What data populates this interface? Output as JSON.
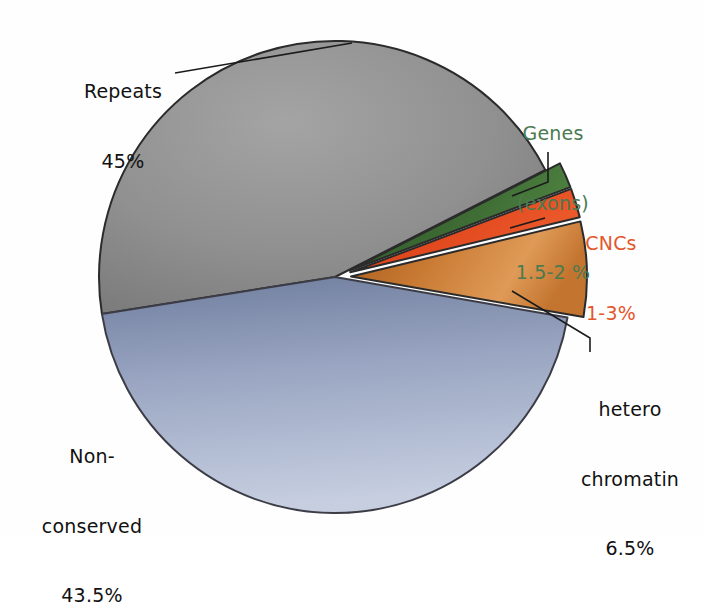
{
  "figure": {
    "background": "#ffffff",
    "center": {
      "x": 335,
      "y": 277
    },
    "radius": 236
  },
  "chart_data": {
    "type": "pie",
    "title": "",
    "subtitle": "",
    "xlabel": "",
    "ylabel": "",
    "legend_position": "none",
    "grid": false,
    "units": "percent of genome",
    "total": 100,
    "categories": [
      "Repeats",
      "Non-conserved",
      "hetero chromatin",
      "CNCs",
      "Genes (exons)"
    ],
    "values": [
      45,
      43.5,
      6.5,
      2,
      1.75
    ],
    "labels": [
      "45%",
      "43.5%",
      "6.5%",
      "1-3%",
      "1.5-2 %"
    ],
    "colors": [
      "#8a8a8a",
      "#8e9ab8",
      "#c87a33",
      "#e2491f",
      "#3d6b33"
    ],
    "slices": [
      {
        "key": "repeats",
        "name": "Repeats",
        "value": 45,
        "value_label": "45%",
        "color": "#8a8a8a",
        "color_dark": "#6e6e6e",
        "color_light": "#b4b4b4",
        "label_color": "#111111",
        "exploded": false,
        "start_angle_deg": 171,
        "end_angle_deg": 333
      },
      {
        "key": "genes",
        "name": "Genes (exons)",
        "value": 1.75,
        "value_label": "1.5-2 %",
        "color": "#3d6b33",
        "color_dark": "#2d5227",
        "color_light": "#4f8241",
        "label_color": "#4b7a4f",
        "exploded": true,
        "start_angle_deg": 333,
        "end_angle_deg": 339.3
      },
      {
        "key": "cncs",
        "name": "CNCs",
        "value": 2,
        "value_label": "1-3%",
        "color": "#e2491f",
        "color_dark": "#c33a14",
        "color_light": "#ef5c2b",
        "label_color": "#e2572c",
        "exploded": true,
        "start_angle_deg": 339.3,
        "end_angle_deg": 346.5
      },
      {
        "key": "heterochromatin",
        "name": "hetero chromatin",
        "value": 6.5,
        "value_label": "6.5%",
        "color": "#c87a33",
        "color_dark": "#a35b1e",
        "color_light": "#e09a55",
        "label_color": "#111111",
        "exploded": true,
        "start_angle_deg": 346.5,
        "end_angle_deg": 369.9
      },
      {
        "key": "non_conserved",
        "name": "Non-conserved",
        "value": 43.5,
        "value_label": "43.5%",
        "color": "#8e9ab8",
        "color_dark": "#6d7b9c",
        "color_light": "#c2cbdd",
        "label_color": "#111111",
        "exploded": false,
        "start_angle_deg": 9.9,
        "end_angle_deg": 171
      }
    ]
  },
  "labels": {
    "repeats": {
      "line1": "Repeats",
      "line2": "45%"
    },
    "genes": {
      "line1": "Genes",
      "line2": "(exons)",
      "line3": "1.5-2 %"
    },
    "cncs": {
      "line1": "CNCs",
      "line2": "1-3%"
    },
    "heterochromatin": {
      "line1": "hetero",
      "line2": "chromatin",
      "line3": "6.5%"
    },
    "non_conserved": {
      "line1": "Non-",
      "line2": "conserved",
      "line3": "43.5%"
    }
  }
}
